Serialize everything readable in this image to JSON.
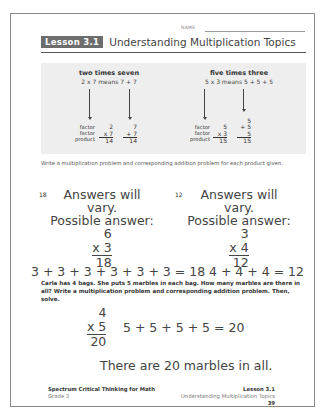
{
  "header": {
    "name_label": "NAME",
    "lesson_badge": "Lesson 3.1",
    "title": "Understanding Multiplication Topics"
  },
  "examples": [
    {
      "title": "two times seven",
      "subtitle": "2 x 7 means 7 + 7",
      "labels": [
        "factor",
        "factor",
        "product"
      ],
      "multiplication": {
        "factor1": "2",
        "factor2": "x 7",
        "product": "14"
      },
      "addition": {
        "addends": [
          "7",
          "+ 7"
        ],
        "sum": "14"
      }
    },
    {
      "title": "five times three",
      "subtitle": "5 x 3 means 5 + 5 + 5",
      "labels": [
        "factor",
        "factor",
        "product"
      ],
      "multiplication": {
        "factor1": "5",
        "factor2": "x 3",
        "product": "15"
      },
      "addition": {
        "addends": [
          "5",
          "+ 5",
          "5"
        ],
        "sum": "15"
      }
    }
  ],
  "instructions": "Write a multiplication problem and corresponding addition problem for each product given.",
  "problems": [
    {
      "number": "18",
      "note_line1": "Answers will vary.",
      "note_line2": "Possible answer:",
      "factor1": "6",
      "factor2": "x 3",
      "product": "18",
      "addition": "3 + 3 + 3 + 3 + 3 + 3 = 18"
    },
    {
      "number": "12",
      "note_line1": "Answers will vary.",
      "note_line2": "Possible answer:",
      "factor1": "3",
      "factor2": "x 4",
      "product": "12",
      "addition": "4 + 4 + 4 = 12"
    }
  ],
  "word_problem": {
    "text": "Carla has 4 bags. She puts 5 marbles in each bag. How many marbles are there in all? Write a multiplication problem and corresponding addition problem. Then, solve.",
    "factor1": "4",
    "factor2": "x 5",
    "product": "20",
    "addition": "5 + 5 + 5 + 5 = 20",
    "answer": "There are 20 marbles in all."
  },
  "footer": {
    "book_title": "Spectrum Critical Thinking for Math",
    "grade": "Grade 3",
    "lesson": "Lesson 3.1",
    "topic": "Understanding Multiplication Topics",
    "page_number": "39"
  }
}
